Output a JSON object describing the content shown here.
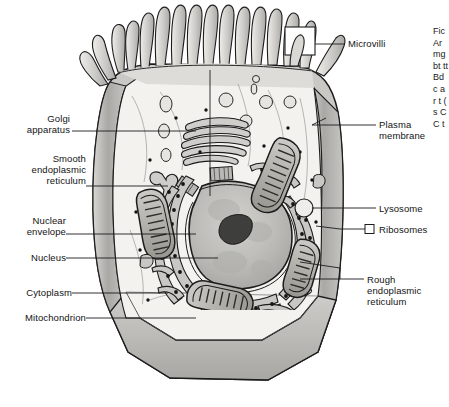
{
  "figure": {
    "type": "labeled biological diagram",
    "background_color": "#ffffff",
    "line_color": "#1a1a1a",
    "cell_fill": "#f2f1ee",
    "membrane_fill": "#b9b8b4",
    "organelle_fill": "#c9c8c4",
    "nucleus_fill": "#bdbcb8",
    "nucleolus_fill": "#4a4a48"
  },
  "labels_left": [
    {
      "id": "golgi-apparatus",
      "text": "Golgi\napparatus",
      "x": 18,
      "y": 113,
      "leader_x1": 72,
      "leader_y1": 131,
      "leader_x2": 196,
      "leader_y2": 131
    },
    {
      "id": "smooth-er",
      "text": "Smooth\nendoplasmic\nreticulum",
      "x": 12,
      "y": 153,
      "leader_x1": 86,
      "leader_y1": 186,
      "leader_x2": 168,
      "leader_y2": 186
    },
    {
      "id": "nuclear-envelope",
      "text": "Nuclear\nenvelope",
      "x": 18,
      "y": 215,
      "leader_x1": 66,
      "leader_y1": 234,
      "leader_x2": 196,
      "leader_y2": 234
    },
    {
      "id": "nucleus",
      "text": "Nucleus",
      "x": 16,
      "y": 253,
      "leader_x1": 66,
      "leader_y1": 258,
      "leader_x2": 218,
      "leader_y2": 258
    },
    {
      "id": "cytoplasm",
      "text": "Cytoplasm",
      "x": 12,
      "y": 288,
      "leader_x1": 72,
      "leader_y1": 293,
      "leader_x2": 168,
      "leader_y2": 293
    },
    {
      "id": "mitochondrion",
      "text": "Mitochondrion",
      "x": 6,
      "y": 313,
      "leader_x1": 86,
      "leader_y1": 318,
      "leader_x2": 196,
      "leader_y2": 318
    }
  ],
  "labels_right": [
    {
      "id": "microvilli",
      "text": "Microvilli",
      "x": 350,
      "y": 39,
      "leader_x1": 312,
      "leader_y1": 44,
      "leader_x2": 345,
      "leader_y2": 44
    },
    {
      "id": "plasma-membrane",
      "text": "Plasma\nmembrane",
      "x": 380,
      "y": 116,
      "leader_x1": 322,
      "leader_y1": 125,
      "leader_x2": 376,
      "leader_y2": 125
    },
    {
      "id": "lysosome",
      "text": "Lysosome",
      "x": 380,
      "y": 203,
      "leader_x1": 318,
      "leader_y1": 208,
      "leader_x2": 376,
      "leader_y2": 208
    },
    {
      "id": "ribosomes",
      "text": "Ribosomes",
      "x": 380,
      "y": 224,
      "leader_x1": 318,
      "leader_y1": 229,
      "leader_x2": 376,
      "leader_y2": 229
    },
    {
      "id": "rough-er",
      "text": "Rough\nendoplasmic\nreticulum",
      "x": 368,
      "y": 274,
      "leader_x1": 300,
      "leader_y1": 279,
      "leader_x2": 364,
      "leader_y2": 279
    }
  ],
  "callout_boxes": [
    {
      "id": "microvilli-box",
      "x": 285,
      "y": 27,
      "w": 30,
      "h": 28
    },
    {
      "id": "ribosomes-box",
      "x": 365,
      "y": 224,
      "w": 9,
      "h": 9
    }
  ],
  "organelles": [
    "microvilli",
    "plasma-membrane",
    "cytoplasm",
    "nucleus",
    "nucleolus",
    "nuclear-envelope",
    "rough-endoplasmic-reticulum",
    "smooth-endoplasmic-reticulum",
    "golgi-apparatus",
    "mitochondrion",
    "lysosome",
    "ribosomes",
    "centrioles",
    "vesicles"
  ],
  "caption_column": {
    "visible_fragment": "Fic Ar mg bt tt Bd c a r t ( s C C t"
  }
}
